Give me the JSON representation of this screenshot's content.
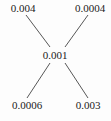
{
  "diagram": {
    "center": {
      "label": "0.001",
      "x": 55,
      "y": 55
    },
    "nodes": [
      {
        "id": "top-left",
        "label": "0.004",
        "x": 23,
        "y": 8
      },
      {
        "id": "top-right",
        "label": "0.0004",
        "x": 90,
        "y": 8
      },
      {
        "id": "bottom-left",
        "label": "0.0006",
        "x": 27,
        "y": 105
      },
      {
        "id": "bottom-right",
        "label": "0.003",
        "x": 88,
        "y": 105
      }
    ],
    "edges": [
      {
        "from": "top-left",
        "to": "center",
        "x1": 26,
        "y1": 15,
        "x2": 50,
        "y2": 47
      },
      {
        "from": "top-right",
        "to": "center",
        "x1": 88,
        "y1": 15,
        "x2": 65,
        "y2": 47
      },
      {
        "from": "bottom-left",
        "to": "center",
        "x1": 50,
        "y1": 63,
        "x2": 27,
        "y2": 98
      },
      {
        "from": "bottom-right",
        "to": "center",
        "x1": 65,
        "y1": 63,
        "x2": 88,
        "y2": 98
      }
    ],
    "line_color": "#444444",
    "text_color": "#222222"
  }
}
